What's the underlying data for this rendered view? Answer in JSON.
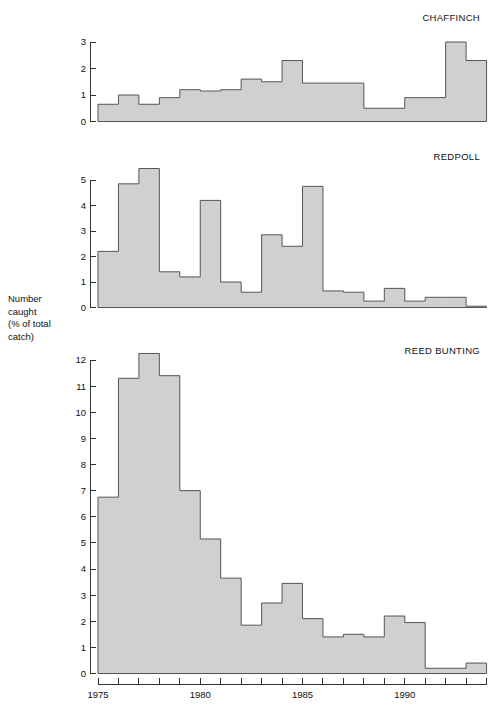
{
  "figure": {
    "axis_label_lines": [
      "Number",
      "caught",
      "(% of total",
      "catch)"
    ],
    "bar_fill": "#d0d0d0",
    "bar_stroke": "#555555",
    "axis_color": "#333333"
  },
  "chart_data": [
    {
      "type": "bar",
      "title": "CHAFFINCH",
      "xlabel": "",
      "ylabel": "Number caught (% of total catch)",
      "grid": false,
      "legend": "none",
      "xlim": [
        1975,
        1994
      ],
      "ylim": [
        0,
        3.2
      ],
      "ytick_labels": [
        "0",
        "1",
        "2",
        "3"
      ],
      "ytick_values": [
        0,
        1,
        2,
        3
      ],
      "categories": [
        1975,
        1976,
        1977,
        1978,
        1979,
        1980,
        1981,
        1982,
        1983,
        1984,
        1985,
        1986,
        1987,
        1988,
        1989,
        1990,
        1991,
        1992,
        1993
      ],
      "values": [
        0.65,
        1.0,
        0.65,
        0.9,
        1.2,
        1.15,
        1.2,
        1.6,
        1.5,
        2.3,
        1.45,
        1.45,
        1.45,
        0.5,
        0.5,
        0.9,
        0.9,
        3.0,
        2.3
      ]
    },
    {
      "type": "bar",
      "title": "REDPOLL",
      "xlabel": "",
      "ylabel": "Number caught (% of total catch)",
      "grid": false,
      "legend": "none",
      "xlim": [
        1975,
        1994
      ],
      "ylim": [
        0,
        5.7
      ],
      "ytick_labels": [
        "0",
        "1",
        "2",
        "3",
        "4",
        "5"
      ],
      "ytick_values": [
        0,
        1,
        2,
        3,
        4,
        5
      ],
      "categories": [
        1975,
        1976,
        1977,
        1978,
        1979,
        1980,
        1981,
        1982,
        1983,
        1984,
        1985,
        1986,
        1987,
        1988,
        1989,
        1990,
        1991,
        1992,
        1993
      ],
      "values": [
        2.2,
        4.85,
        5.45,
        1.4,
        1.2,
        4.2,
        1.0,
        0.6,
        2.85,
        2.4,
        4.75,
        0.65,
        0.6,
        0.25,
        0.75,
        0.25,
        0.4,
        0.4,
        0.05
      ]
    },
    {
      "type": "bar",
      "title": "REED BUNTING",
      "xlabel": "",
      "ylabel": "Number caught (% of total catch)",
      "grid": false,
      "legend": "none",
      "xlim": [
        1975,
        1994
      ],
      "ylim": [
        0,
        12.4
      ],
      "ytick_labels": [
        "0",
        "1",
        "2",
        "3",
        "4",
        "5",
        "6",
        "7",
        "8",
        "9",
        "10",
        "11",
        "12"
      ],
      "ytick_values": [
        0,
        1,
        2,
        3,
        4,
        5,
        6,
        7,
        8,
        9,
        10,
        11,
        12
      ],
      "xtick_labels": [
        "1975",
        "1980",
        "1985",
        "1990"
      ],
      "xtick_values": [
        1975,
        1980,
        1985,
        1990
      ],
      "categories": [
        1975,
        1976,
        1977,
        1978,
        1979,
        1980,
        1981,
        1982,
        1983,
        1984,
        1985,
        1986,
        1987,
        1988,
        1989,
        1990,
        1991,
        1992,
        1993
      ],
      "values": [
        6.75,
        11.3,
        12.25,
        11.4,
        7.0,
        5.15,
        3.65,
        1.85,
        2.7,
        3.45,
        2.1,
        1.4,
        1.5,
        1.4,
        2.2,
        1.95,
        0.2,
        0.2,
        0.4
      ]
    }
  ]
}
